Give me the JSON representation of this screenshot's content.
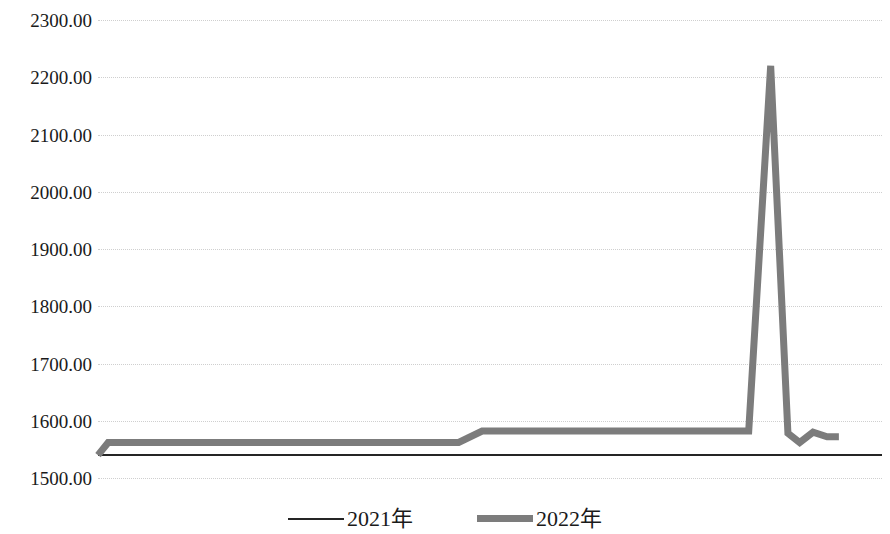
{
  "chart_data": {
    "type": "line",
    "title": "",
    "subtitle": "",
    "xlabel": "",
    "ylabel": "",
    "ylim": [
      1500,
      2300
    ],
    "ytick_labels": [
      "2300.00",
      "2200.00",
      "2100.00",
      "2000.00",
      "1900.00",
      "1800.00",
      "1700.00",
      "1600.00",
      "1500.00"
    ],
    "ytick_values": [
      2300,
      2200,
      2100,
      2000,
      1900,
      1800,
      1700,
      1600,
      1500
    ],
    "ytick_step": 100,
    "xtick_labels": [],
    "grid": "horizontal-dotted",
    "legend_position": "bottom-center",
    "series": [
      {
        "name": "2021年",
        "color": "#252525",
        "line_width": 2,
        "points": [
          {
            "x": 0.0,
            "y": 1540
          },
          {
            "x": 0.25,
            "y": 1540
          },
          {
            "x": 0.5,
            "y": 1540
          },
          {
            "x": 0.75,
            "y": 1540
          },
          {
            "x": 1.0,
            "y": 1540
          }
        ]
      },
      {
        "name": "2022年",
        "color": "#7c7c7c",
        "line_width": 7,
        "points": [
          {
            "x": 0.0,
            "y": 1540
          },
          {
            "x": 0.013,
            "y": 1562
          },
          {
            "x": 0.46,
            "y": 1562
          },
          {
            "x": 0.49,
            "y": 1582
          },
          {
            "x": 0.83,
            "y": 1582
          },
          {
            "x": 0.858,
            "y": 2220
          },
          {
            "x": 0.88,
            "y": 1578
          },
          {
            "x": 0.895,
            "y": 1562
          },
          {
            "x": 0.912,
            "y": 1580
          },
          {
            "x": 0.93,
            "y": 1572
          },
          {
            "x": 0.945,
            "y": 1572
          }
        ]
      }
    ],
    "annotations": {
      "peak_value": 2220,
      "peak_series": "2022年"
    }
  },
  "legend": {
    "entries": [
      {
        "label": "2021年",
        "style": "thin",
        "color": "#252525"
      },
      {
        "label": "2022年",
        "style": "thick",
        "color": "#7c7c7c"
      }
    ]
  }
}
